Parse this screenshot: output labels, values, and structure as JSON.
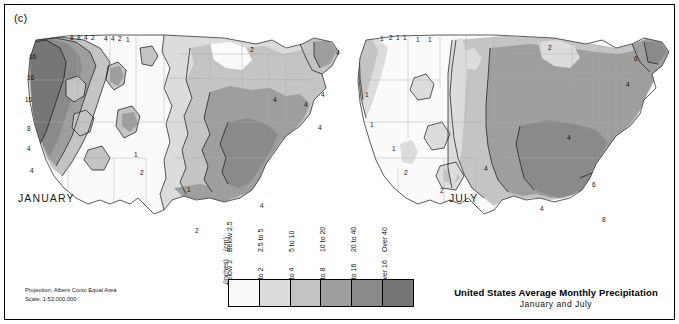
{
  "figure": {
    "panel_label": "(c)",
    "title_main": "United States Average Monthly Precipitation",
    "title_sub": "January and July",
    "projection_line1": "Projection: Albers Conic Equal Area",
    "projection_line2": "Scale: 1:53,000,000"
  },
  "maps": [
    {
      "id": "january",
      "label": "JANUARY",
      "contour_labels": [
        {
          "value": "8",
          "x": 56,
          "y": 17
        },
        {
          "value": "8",
          "x": 63,
          "y": 17
        },
        {
          "value": "4",
          "x": 70,
          "y": 17
        },
        {
          "value": "2",
          "x": 77,
          "y": 17
        },
        {
          "value": "4",
          "x": 90,
          "y": 18
        },
        {
          "value": "4",
          "x": 97,
          "y": 18
        },
        {
          "value": "2",
          "x": 104,
          "y": 18
        },
        {
          "value": "1",
          "x": 112,
          "y": 19
        },
        {
          "value": "16",
          "x": 15,
          "y": 36
        },
        {
          "value": "16",
          "x": 13,
          "y": 57
        },
        {
          "value": "16",
          "x": 11,
          "y": 79
        },
        {
          "value": "8",
          "x": 13,
          "y": 108
        },
        {
          "value": "4",
          "x": 13,
          "y": 128
        },
        {
          "value": "4",
          "x": 16,
          "y": 150
        },
        {
          "value": "1",
          "x": 120,
          "y": 134
        },
        {
          "value": "2",
          "x": 126,
          "y": 152
        },
        {
          "value": "1",
          "x": 173,
          "y": 169
        },
        {
          "value": "2",
          "x": 181,
          "y": 210
        },
        {
          "value": "4",
          "x": 246,
          "y": 185
        },
        {
          "value": "4",
          "x": 290,
          "y": 84
        },
        {
          "value": "4",
          "x": 304,
          "y": 107
        },
        {
          "value": "4",
          "x": 322,
          "y": 32
        },
        {
          "value": "4",
          "x": 307,
          "y": 74
        },
        {
          "value": "2",
          "x": 236,
          "y": 29
        },
        {
          "value": "4",
          "x": 259,
          "y": 79
        }
      ]
    },
    {
      "id": "july",
      "label": "JULY",
      "contour_labels": [
        {
          "value": "1",
          "x": 36,
          "y": 18
        },
        {
          "value": "2",
          "x": 45,
          "y": 17
        },
        {
          "value": "1",
          "x": 52,
          "y": 17
        },
        {
          "value": "1",
          "x": 59,
          "y": 17
        },
        {
          "value": "1",
          "x": 72,
          "y": 19
        },
        {
          "value": "1",
          "x": 84,
          "y": 19
        },
        {
          "value": "2",
          "x": 204,
          "y": 27
        },
        {
          "value": "1",
          "x": 21,
          "y": 74
        },
        {
          "value": "1",
          "x": 26,
          "y": 104
        },
        {
          "value": "1",
          "x": 48,
          "y": 128
        },
        {
          "value": "2",
          "x": 60,
          "y": 152
        },
        {
          "value": "2",
          "x": 96,
          "y": 170
        },
        {
          "value": "4",
          "x": 140,
          "y": 148
        },
        {
          "value": "4",
          "x": 223,
          "y": 117
        },
        {
          "value": "4",
          "x": 282,
          "y": 64
        },
        {
          "value": "6",
          "x": 290,
          "y": 38
        },
        {
          "value": "8",
          "x": 258,
          "y": 199
        },
        {
          "value": "6",
          "x": 248,
          "y": 164
        },
        {
          "value": "4",
          "x": 196,
          "y": 188
        }
      ]
    }
  ],
  "legend": {
    "unit_inches": "(inches)",
    "unit_cm": "(cm)",
    "classes": [
      {
        "inches": "Below 1",
        "cm": "Below 2.5",
        "color": "#fafafa"
      },
      {
        "inches": "1 to 2",
        "cm": "2.5 to 5",
        "color": "#dcdcdc"
      },
      {
        "inches": "2 to 4",
        "cm": "5 to 10",
        "color": "#c4c4c4"
      },
      {
        "inches": "4 to 8",
        "cm": "10 to 20",
        "color": "#9e9e9e"
      },
      {
        "inches": "8 to 16",
        "cm": "20 to 40",
        "color": "#8a8a8a"
      },
      {
        "inches": "Over 16",
        "cm": "Over 40",
        "color": "#767676"
      }
    ]
  }
}
